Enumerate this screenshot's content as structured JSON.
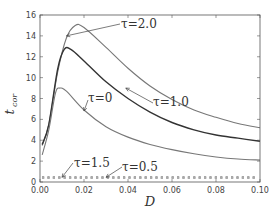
{
  "chart_data": {
    "type": "line",
    "title": "",
    "xlabel": "D",
    "ylabel": "t_cor",
    "xlim": [
      0.0,
      0.1
    ],
    "ylim": [
      0,
      16
    ],
    "grid": false,
    "legend": "none (inline annotations with arrows)",
    "x_ticks": [
      "0.00",
      "0.02",
      "0.04",
      "0.06",
      "0.08",
      "0.10"
    ],
    "y_ticks": [
      "0",
      "2",
      "4",
      "6",
      "8",
      "10",
      "12",
      "14",
      "16"
    ],
    "series": [
      {
        "name": "τ=2.0",
        "style": "solid",
        "color": "#777777",
        "x": [
          0.001,
          0.004,
          0.008,
          0.012,
          0.016,
          0.02,
          0.03,
          0.04,
          0.05,
          0.06,
          0.07,
          0.08,
          0.09,
          0.1
        ],
        "y": [
          3.5,
          5.5,
          10.5,
          13.8,
          15.0,
          14.8,
          12.9,
          10.9,
          9.2,
          7.9,
          6.9,
          6.2,
          5.6,
          5.2
        ]
      },
      {
        "name": "τ=1.0",
        "style": "solid",
        "color": "#333333",
        "x": [
          0.001,
          0.004,
          0.008,
          0.011,
          0.014,
          0.02,
          0.03,
          0.04,
          0.05,
          0.06,
          0.07,
          0.08,
          0.09,
          0.1
        ],
        "y": [
          3.6,
          5.5,
          10.8,
          12.7,
          12.7,
          11.6,
          9.6,
          8.0,
          6.7,
          5.7,
          5.0,
          4.5,
          4.2,
          3.9
        ]
      },
      {
        "name": "τ=0",
        "style": "solid",
        "color": "#777777",
        "x": [
          0.001,
          0.004,
          0.007,
          0.009,
          0.012,
          0.02,
          0.03,
          0.04,
          0.05,
          0.06,
          0.07,
          0.08,
          0.09,
          0.1
        ],
        "y": [
          2.6,
          5.0,
          8.5,
          9.0,
          8.7,
          6.9,
          5.3,
          4.3,
          3.6,
          3.1,
          2.7,
          2.4,
          2.2,
          2.1
        ]
      },
      {
        "name": "τ=1.5",
        "style": "dotted",
        "color": "#888888",
        "x": [
          0.0,
          0.1
        ],
        "y": [
          0.45,
          0.45
        ]
      },
      {
        "name": "τ=0.5",
        "style": "dotted",
        "color": "#aaaaaa",
        "x": [
          0.0,
          0.1
        ],
        "y": [
          0.4,
          0.4
        ]
      }
    ],
    "annotations": [
      {
        "text": "τ=2.0",
        "arrow_to": [
          0.012,
          14.0
        ]
      },
      {
        "text": "τ=1.0",
        "arrow_to": [
          0.039,
          9.0
        ]
      },
      {
        "text": "τ=0",
        "arrow_to": [
          0.02,
          6.8
        ]
      },
      {
        "text": "τ=1.5",
        "arrow_to": [
          0.01,
          0.45
        ]
      },
      {
        "text": "τ=0.5",
        "arrow_to": [
          0.03,
          0.45
        ]
      }
    ]
  },
  "labels": {
    "xlabel": "D",
    "ylabel_main": "t",
    "ylabel_sub": "cor",
    "ann_tau20": "τ=2.0",
    "ann_tau10": "τ=1.0",
    "ann_tau0": "τ=0",
    "ann_tau15": "τ=1.5",
    "ann_tau05": "τ=0.5"
  }
}
